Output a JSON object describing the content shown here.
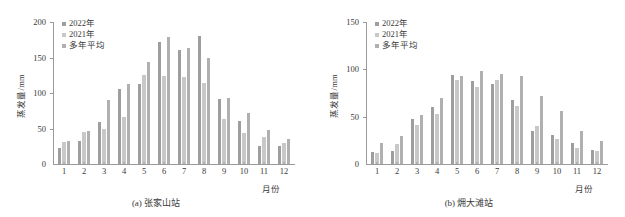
{
  "figure": {
    "series_colors": {
      "y2022": "#9e9e9e",
      "y2021": "#c8c8c8",
      "mean": "#b0b0b0"
    },
    "axis_color": "#9a9a9a"
  },
  "chart_data": [
    {
      "type": "bar",
      "title": "(a) 张家山站",
      "panel_label": "(a)",
      "station": "张家山站",
      "xlabel": "月份",
      "ylabel": "蒸发量/mm",
      "ylim": [
        0,
        200
      ],
      "yticks": [
        0,
        50,
        100,
        150,
        200
      ],
      "ytick_labels": [
        "0",
        "50",
        "100",
        "150",
        "200"
      ],
      "grid": false,
      "legend_position": "top-left",
      "categories": [
        "1",
        "2",
        "3",
        "4",
        "5",
        "6",
        "7",
        "8",
        "9",
        "10",
        "11",
        "12"
      ],
      "series": [
        {
          "name": "2022年",
          "values": [
            23,
            33,
            59,
            106,
            113,
            172,
            160,
            180,
            92,
            61,
            25,
            26
          ]
        },
        {
          "name": "2021年",
          "values": [
            31,
            45,
            49,
            66,
            126,
            124,
            123,
            114,
            64,
            43,
            38,
            29
          ]
        },
        {
          "name": "多年平均",
          "values": [
            32,
            46,
            90,
            113,
            143,
            179,
            164,
            149,
            93,
            72,
            48,
            35
          ]
        }
      ]
    },
    {
      "type": "bar",
      "title": "(b) 㶲大滩站",
      "panel_label": "(b)",
      "station": "㶲大滩站",
      "xlabel": "月份",
      "ylabel": "蒸发量/mm",
      "ylim": [
        0,
        150
      ],
      "yticks": [
        0,
        50,
        100,
        150
      ],
      "ytick_labels": [
        "0",
        "50",
        "100",
        "150"
      ],
      "grid": false,
      "legend_position": "top-left",
      "categories": [
        "1",
        "2",
        "3",
        "4",
        "5",
        "6",
        "7",
        "8",
        "9",
        "10",
        "11",
        "12"
      ],
      "series": [
        {
          "name": "2022年",
          "values": [
            13,
            14,
            48,
            60,
            94,
            88,
            85,
            68,
            35,
            31,
            22,
            15
          ]
        },
        {
          "name": "2021年",
          "values": [
            12,
            21,
            41,
            53,
            89,
            81,
            89,
            61,
            40,
            26,
            17,
            14
          ]
        },
        {
          "name": "多年平均",
          "values": [
            22,
            30,
            52,
            70,
            93,
            98,
            95,
            93,
            72,
            56,
            35,
            24
          ]
        }
      ]
    }
  ]
}
